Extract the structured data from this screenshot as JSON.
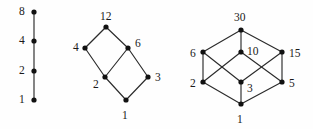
{
  "figure": {
    "width": 313,
    "height": 129,
    "background_color": "#fefefe",
    "node_color": "#111111",
    "edge_color": "#2b2b2b",
    "label_color": "#1a1a1a"
  },
  "chart_data": {
    "type": "diagram",
    "diagram_type": "hasse-diagram",
    "title": "",
    "subtitle": "",
    "xlabel": "",
    "ylabel": "",
    "lattices": [
      {
        "name": "divisors-of-8",
        "top_element": "8",
        "bottom_element": "1",
        "nodes": [
          {
            "id": "n8_1",
            "label": "1",
            "x": 34,
            "y": 100,
            "label_x": 19,
            "label_y": 94
          },
          {
            "id": "n8_2",
            "label": "2",
            "x": 34,
            "y": 71,
            "label_x": 19,
            "label_y": 65
          },
          {
            "id": "n8_4",
            "label": "4",
            "x": 34,
            "y": 41,
            "label_x": 19,
            "label_y": 35
          },
          {
            "id": "n8_8",
            "label": "8",
            "x": 34,
            "y": 12,
            "label_x": 19,
            "label_y": 6
          }
        ],
        "edges": [
          {
            "from": "n8_1",
            "to": "n8_2"
          },
          {
            "from": "n8_2",
            "to": "n8_4"
          },
          {
            "from": "n8_4",
            "to": "n8_8"
          }
        ]
      },
      {
        "name": "divisors-of-12",
        "top_element": "12",
        "bottom_element": "1",
        "nodes": [
          {
            "id": "n12_1",
            "label": "1",
            "x": 126,
            "y": 100,
            "label_x": 122,
            "label_y": 110
          },
          {
            "id": "n12_2",
            "label": "2",
            "x": 105,
            "y": 77,
            "label_x": 93,
            "label_y": 79
          },
          {
            "id": "n12_3",
            "label": "3",
            "x": 148,
            "y": 77,
            "label_x": 155,
            "label_y": 72
          },
          {
            "id": "n12_4",
            "label": "4",
            "x": 85,
            "y": 48,
            "label_x": 73,
            "label_y": 42
          },
          {
            "id": "n12_6",
            "label": "6",
            "x": 128,
            "y": 48,
            "label_x": 135,
            "label_y": 38
          },
          {
            "id": "n12_12",
            "label": "12",
            "x": 106,
            "y": 27,
            "label_x": 100,
            "label_y": 11
          }
        ],
        "edges": [
          {
            "from": "n12_1",
            "to": "n12_2"
          },
          {
            "from": "n12_1",
            "to": "n12_3"
          },
          {
            "from": "n12_2",
            "to": "n12_4"
          },
          {
            "from": "n12_2",
            "to": "n12_6"
          },
          {
            "from": "n12_3",
            "to": "n12_6"
          },
          {
            "from": "n12_4",
            "to": "n12_12"
          },
          {
            "from": "n12_6",
            "to": "n12_12"
          }
        ]
      },
      {
        "name": "divisors-of-30",
        "top_element": "30",
        "bottom_element": "1",
        "nodes": [
          {
            "id": "n30_1",
            "label": "1",
            "x": 241,
            "y": 104,
            "label_x": 237,
            "label_y": 114
          },
          {
            "id": "n30_2",
            "label": "2",
            "x": 203,
            "y": 82,
            "label_x": 190,
            "label_y": 78
          },
          {
            "id": "n30_3",
            "label": "3",
            "x": 241,
            "y": 82,
            "label_x": 247,
            "label_y": 83
          },
          {
            "id": "n30_5",
            "label": "5",
            "x": 282,
            "y": 82,
            "label_x": 289,
            "label_y": 78
          },
          {
            "id": "n30_6",
            "label": "6",
            "x": 203,
            "y": 52,
            "label_x": 190,
            "label_y": 48
          },
          {
            "id": "n30_10",
            "label": "10",
            "x": 241,
            "y": 52,
            "label_x": 247,
            "label_y": 46
          },
          {
            "id": "n30_15",
            "label": "15",
            "x": 282,
            "y": 52,
            "label_x": 289,
            "label_y": 48
          },
          {
            "id": "n30_30",
            "label": "30",
            "x": 241,
            "y": 30,
            "label_x": 234,
            "label_y": 12
          }
        ],
        "edges": [
          {
            "from": "n30_1",
            "to": "n30_2"
          },
          {
            "from": "n30_1",
            "to": "n30_3"
          },
          {
            "from": "n30_1",
            "to": "n30_5"
          },
          {
            "from": "n30_2",
            "to": "n30_6"
          },
          {
            "from": "n30_2",
            "to": "n30_10"
          },
          {
            "from": "n30_3",
            "to": "n30_6"
          },
          {
            "from": "n30_3",
            "to": "n30_15"
          },
          {
            "from": "n30_5",
            "to": "n30_10"
          },
          {
            "from": "n30_5",
            "to": "n30_15"
          },
          {
            "from": "n30_6",
            "to": "n30_30"
          },
          {
            "from": "n30_10",
            "to": "n30_30"
          },
          {
            "from": "n30_15",
            "to": "n30_30"
          }
        ]
      }
    ]
  }
}
